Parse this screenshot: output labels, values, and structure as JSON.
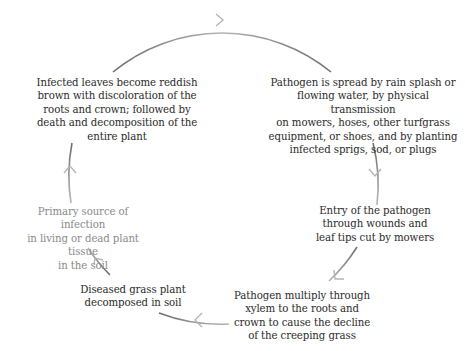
{
  "diagram": {
    "type": "cycle",
    "colors": {
      "text": "#2b2b2b",
      "muted_text": "#8a8a8a",
      "arc_dark": "#6e6e6e",
      "arc_light": "#b5b5b5"
    },
    "nodes": [
      {
        "id": "infected-leaves",
        "text": "Infected leaves become reddish\nbrown with discoloration of the\nroots and crown; followed by\ndeath and decomposition of the\nentire plant"
      },
      {
        "id": "pathogen-spread",
        "text": "Pathogen is spread by rain splash or\nflowing water, by physical transmission\non mowers, hoses, other turfgrass\nequipment, or shoes, and by planting\ninfected sprigs, sod, or plugs"
      },
      {
        "id": "pathogen-entry",
        "text": "Entry of the pathogen\nthrough wounds and\nleaf tips cut by mowers"
      },
      {
        "id": "pathogen-multiply",
        "text": "Pathogen multiply through\nxylem to the roots and\ncrown to cause the decline\nof the creeping grass"
      },
      {
        "id": "diseased-plant",
        "text": "Diseased grass plant\ndecomposed in soil"
      },
      {
        "id": "primary-source",
        "text": "Primary source of infection\nin living or dead plant tissue\nin the soil"
      }
    ],
    "flow": [
      "primary-source -> infected-leaves",
      "infected-leaves -> pathogen-spread",
      "pathogen-spread -> pathogen-entry",
      "pathogen-entry -> pathogen-multiply",
      "pathogen-multiply -> diseased-plant",
      "diseased-plant -> primary-source"
    ]
  }
}
